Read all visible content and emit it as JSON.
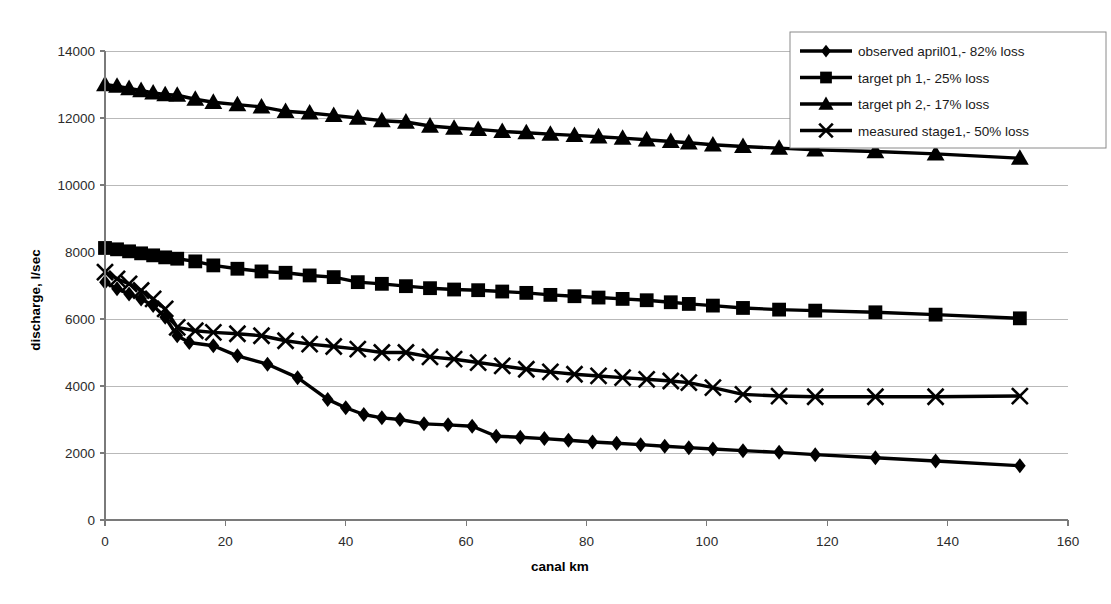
{
  "chart_data": {
    "type": "line",
    "title": "",
    "xlabel": "canal km",
    "ylabel": "discharge, l/sec",
    "xlim": [
      0,
      160
    ],
    "ylim": [
      0,
      14000
    ],
    "xticks": [
      0,
      20,
      40,
      60,
      80,
      100,
      120,
      140,
      160
    ],
    "yticks": [
      0,
      2000,
      4000,
      6000,
      8000,
      10000,
      12000,
      14000
    ],
    "grid": "horizontal",
    "legend_position": "top-right",
    "series": [
      {
        "name": "observed april01,- 82% loss",
        "marker": "diamond",
        "x": [
          0,
          2,
          4,
          6,
          8,
          10,
          12,
          14,
          18,
          22,
          27,
          32,
          37,
          40,
          43,
          46,
          49,
          53,
          57,
          61,
          65,
          69,
          73,
          77,
          81,
          85,
          89,
          93,
          97,
          101,
          106,
          112,
          118,
          128,
          138,
          152
        ],
        "y": [
          7100,
          6900,
          6750,
          6600,
          6400,
          6050,
          5500,
          5300,
          5200,
          4900,
          4650,
          4250,
          3600,
          3350,
          3150,
          3050,
          3000,
          2870,
          2840,
          2800,
          2500,
          2470,
          2430,
          2380,
          2330,
          2290,
          2250,
          2200,
          2160,
          2120,
          2070,
          2020,
          1950,
          1860,
          1760,
          1620
        ]
      },
      {
        "name": "target ph 1,- 25% loss",
        "marker": "square",
        "x": [
          0,
          2,
          4,
          6,
          8,
          10,
          12,
          15,
          18,
          22,
          26,
          30,
          34,
          38,
          42,
          46,
          50,
          54,
          58,
          62,
          66,
          70,
          74,
          78,
          82,
          86,
          90,
          94,
          97,
          101,
          106,
          112,
          118,
          128,
          138,
          152
        ],
        "y": [
          8120,
          8080,
          8020,
          7960,
          7900,
          7840,
          7800,
          7720,
          7600,
          7500,
          7420,
          7380,
          7300,
          7250,
          7100,
          7050,
          6980,
          6920,
          6880,
          6860,
          6820,
          6780,
          6720,
          6680,
          6640,
          6600,
          6560,
          6500,
          6450,
          6400,
          6330,
          6280,
          6250,
          6200,
          6130,
          6020
        ]
      },
      {
        "name": "target ph 2,- 17% loss",
        "marker": "triangle",
        "x": [
          0,
          2,
          4,
          6,
          8,
          10,
          12,
          15,
          18,
          22,
          26,
          30,
          34,
          38,
          42,
          46,
          50,
          54,
          58,
          62,
          66,
          70,
          74,
          78,
          82,
          86,
          90,
          94,
          97,
          101,
          106,
          112,
          118,
          128,
          138,
          152
        ],
        "y": [
          13000,
          12950,
          12880,
          12820,
          12750,
          12700,
          12680,
          12560,
          12470,
          12400,
          12330,
          12200,
          12150,
          12080,
          12000,
          11920,
          11880,
          11760,
          11700,
          11660,
          11600,
          11560,
          11520,
          11480,
          11440,
          11400,
          11350,
          11300,
          11260,
          11200,
          11150,
          11100,
          11050,
          11000,
          10930,
          10800
        ]
      },
      {
        "name": "measured stage1,- 50% loss",
        "marker": "x",
        "x": [
          0,
          2,
          4,
          6,
          8,
          10,
          12,
          15,
          18,
          22,
          26,
          30,
          34,
          38,
          42,
          46,
          50,
          54,
          58,
          62,
          66,
          70,
          74,
          78,
          82,
          86,
          90,
          94,
          97,
          101,
          106,
          112,
          118,
          128,
          138,
          152
        ],
        "y": [
          7400,
          7200,
          7050,
          6850,
          6600,
          6300,
          5750,
          5650,
          5600,
          5560,
          5500,
          5350,
          5250,
          5180,
          5100,
          5000,
          5000,
          4870,
          4800,
          4700,
          4600,
          4500,
          4420,
          4350,
          4300,
          4250,
          4200,
          4150,
          4100,
          3950,
          3750,
          3700,
          3680,
          3680,
          3680,
          3700
        ]
      }
    ]
  },
  "axes": {
    "x_title": "canal km",
    "y_title": "discharge, l/sec",
    "x_tick_labels": [
      "0",
      "20",
      "40",
      "60",
      "80",
      "100",
      "120",
      "140",
      "160"
    ],
    "y_tick_labels": [
      "0",
      "2000",
      "4000",
      "6000",
      "8000",
      "10000",
      "12000",
      "14000"
    ]
  },
  "legend": {
    "items": [
      {
        "label": "observed april01,- 82% loss",
        "marker": "diamond"
      },
      {
        "label": "target ph 1,- 25% loss",
        "marker": "square"
      },
      {
        "label": "target ph 2,- 17% loss",
        "marker": "triangle"
      },
      {
        "label": "measured stage1,- 50% loss",
        "marker": "x"
      }
    ]
  },
  "colors": {
    "series": "#000000",
    "gridline": "#b9b9b9",
    "axis": "#7a7a7a",
    "background": "#ffffff"
  }
}
